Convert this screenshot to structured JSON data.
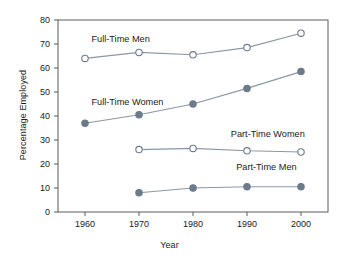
{
  "chart_data": {
    "type": "line",
    "title": "",
    "xlabel": "Year",
    "ylabel": "Percentage Employed",
    "categories": [
      1960,
      1970,
      1980,
      1990,
      2000
    ],
    "x": [
      1960,
      1970,
      1980,
      1990,
      2000
    ],
    "xlim": [
      1955,
      2005
    ],
    "ylim": [
      0,
      80
    ],
    "ytick_labels": [
      "0",
      "10",
      "20",
      "30",
      "40",
      "50",
      "60",
      "70",
      "80"
    ],
    "ytick_values": [
      0,
      10,
      20,
      30,
      40,
      50,
      60,
      70,
      80
    ],
    "xtick_labels": [
      "1960",
      "1970",
      "1980",
      "1990",
      "2000"
    ],
    "grid": false,
    "legend_position": "inline-annotations",
    "series": [
      {
        "name": "Full-Time Men",
        "marker": "open-circle",
        "x": [
          1960,
          1970,
          1980,
          1990,
          2000
        ],
        "values": [
          64,
          66.5,
          65.5,
          68.5,
          74.5
        ]
      },
      {
        "name": "Full-Time Women",
        "marker": "filled-circle",
        "x": [
          1960,
          1970,
          1980,
          1990,
          2000
        ],
        "values": [
          37,
          40.5,
          45,
          51.5,
          58.5
        ]
      },
      {
        "name": "Part-Time Women",
        "marker": "open-circle",
        "x": [
          1970,
          1980,
          1990,
          2000
        ],
        "values": [
          26,
          26.5,
          25.5,
          25
        ]
      },
      {
        "name": "Part-Time Men",
        "marker": "filled-circle",
        "x": [
          1970,
          1980,
          1990,
          2000
        ],
        "values": [
          8,
          10,
          10.5,
          10.5
        ]
      }
    ],
    "annotations": [
      {
        "text": "Full-Time Men",
        "x": 1961.2,
        "y": 71.5
      },
      {
        "text": "Full-Time Women",
        "x": 1961.2,
        "y": 45.5
      },
      {
        "text": "Part-Time Women",
        "x": 1987.0,
        "y": 32.0
      },
      {
        "text": "Part-Time Men",
        "x": 1988.0,
        "y": 18.5
      }
    ],
    "colors": {
      "marker": "#6b7b8c",
      "line": "#8a97a5",
      "marker_fill_open": "#ffffff",
      "axis": "#5a5a5a",
      "text": "#1a1a1a",
      "background": "#ffffff"
    }
  }
}
